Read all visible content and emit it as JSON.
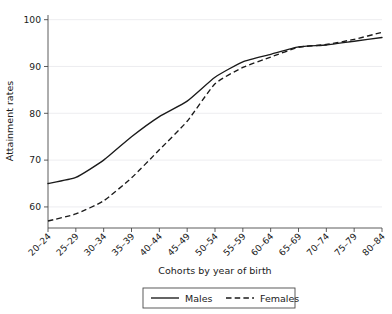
{
  "chart_data": {
    "type": "line",
    "title": "",
    "xlabel": "Cohorts by year of birth",
    "ylabel": "Attainment rates",
    "categories": [
      "20–24",
      "25–29",
      "30–34",
      "35–39",
      "40–44",
      "45–49",
      "50–54",
      "55–59",
      "60–64",
      "65–69",
      "70–74",
      "75–79",
      "80–84"
    ],
    "yticks": [
      60,
      70,
      80,
      90,
      100
    ],
    "ylim": [
      55.5,
      101
    ],
    "grid": true,
    "legend_position": "bottom-center",
    "series": [
      {
        "name": "Males",
        "style": "solid",
        "color": "#1a1a1a",
        "values": [
          65.0,
          66.3,
          70.0,
          75.0,
          79.3,
          82.6,
          87.7,
          91.0,
          92.6,
          94.2,
          94.6,
          95.4,
          96.2
        ]
      },
      {
        "name": "Females",
        "style": "dashed",
        "color": "#1a1a1a",
        "values": [
          57.0,
          58.5,
          61.3,
          66.2,
          72.2,
          78.3,
          86.3,
          89.8,
          92.0,
          94.1,
          94.7,
          95.8,
          97.3
        ]
      }
    ]
  },
  "axes": {
    "y_axis_label": "Attainment rates",
    "x_axis_label": "Cohorts by year of birth",
    "y_tick_labels": [
      "60",
      "70",
      "80",
      "90",
      "100"
    ],
    "x_tick_labels": [
      "20–24",
      "25–29",
      "30–34",
      "35–39",
      "40–44",
      "45–49",
      "50–54",
      "55–59",
      "60–64",
      "65–69",
      "70–74",
      "75–79",
      "80–84"
    ]
  },
  "legend": {
    "items": [
      {
        "label": "Males",
        "style": "solid"
      },
      {
        "label": "Females",
        "style": "dashed"
      }
    ]
  },
  "colors": {
    "line": "#1a1a1a",
    "axis": "#4a4a4a",
    "grid": "#e8e8ec",
    "background": "#ffffff"
  }
}
